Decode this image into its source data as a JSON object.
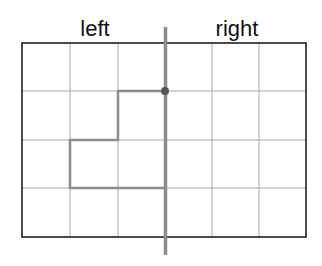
{
  "labels": {
    "left": "left",
    "right": "right"
  },
  "grid": {
    "columns": 6,
    "rows": 4,
    "x": [
      22,
      70,
      118,
      165,
      212,
      259,
      306
    ],
    "y": [
      43,
      91,
      140,
      188,
      237
    ],
    "border_color": "#111111",
    "line_color": "#aaaaaa"
  },
  "mirror_line": {
    "x": 165,
    "y1": 27,
    "y2": 255,
    "color": "#8c8c8c"
  },
  "shape": {
    "points": "165,91 118,91 118,140 70,140 70,188 165,188",
    "color": "#8c8c8c",
    "start_dot": {
      "x": 165,
      "y": 91,
      "color": "#555555"
    }
  }
}
